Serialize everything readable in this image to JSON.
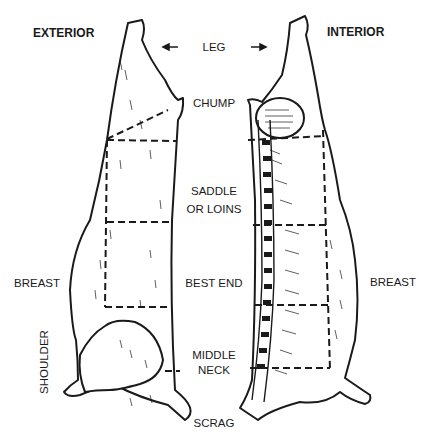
{
  "diagram": {
    "views": [
      {
        "id": "exterior",
        "label": "EXTERIOR"
      },
      {
        "id": "interior",
        "label": "INTERIOR"
      }
    ],
    "cuts": [
      {
        "id": "leg",
        "label": "LEG"
      },
      {
        "id": "chump",
        "label": "CHUMP"
      },
      {
        "id": "saddle",
        "label_line1": "SADDLE",
        "label_line2": "OR LOINS"
      },
      {
        "id": "best-end",
        "label": "BEST END"
      },
      {
        "id": "middle-neck",
        "label_line1": "MIDDLE",
        "label_line2": "NECK"
      },
      {
        "id": "scrag",
        "label": "SCRAG"
      }
    ],
    "side_labels": {
      "breast_left": "BREAST",
      "breast_right": "BREAST",
      "shoulder": "SHOULDER"
    },
    "colors": {
      "ink": "#1a1a1a",
      "background": "#ffffff"
    }
  }
}
